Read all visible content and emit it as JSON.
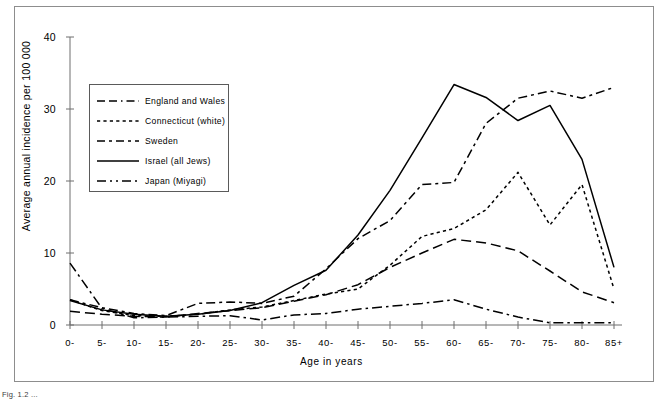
{
  "figure": {
    "caption": "Fig. 1.2 ...",
    "frame_color": "#8d8d8d"
  },
  "chart_data": {
    "type": "line",
    "title": "",
    "xlabel": "Age in years",
    "ylabel": "Average annual incidence per 100 000",
    "categories": [
      "0-",
      "5-",
      "10-",
      "15-",
      "20-",
      "25-",
      "30-",
      "35-",
      "40-",
      "45-",
      "50-",
      "55-",
      "60-",
      "65-",
      "70-",
      "75-",
      "80-",
      "85+"
    ],
    "xlim": [
      0,
      17
    ],
    "ylim": [
      0,
      40
    ],
    "yticks": [
      0,
      10,
      20,
      30,
      40
    ],
    "grid": false,
    "legend_position": "upper-left-inside",
    "series": [
      {
        "name": "England and Wales",
        "dash": "long-dash",
        "legend_label": "England and Wales",
        "values": [
          1.9,
          1.5,
          1.2,
          1.1,
          1.6,
          2.0,
          2.4,
          3.3,
          4.2,
          5.6,
          8.0,
          10.0,
          11.9,
          11.4,
          10.3,
          7.5,
          4.6,
          3.1
        ]
      },
      {
        "name": "Connecticut (white)",
        "dash": "dotted",
        "legend_label": "Connecticut  (white)",
        "values": [
          3.5,
          2.0,
          1.3,
          1.2,
          1.5,
          2.1,
          2.5,
          3.4,
          4.3,
          5.0,
          8.3,
          12.3,
          13.4,
          16.0,
          21.2,
          13.9,
          19.5,
          5.0
        ]
      },
      {
        "name": "Sweden",
        "dash": "dash-dot",
        "legend_label": "Sweden",
        "values": [
          3.5,
          2.4,
          1.6,
          1.3,
          3.0,
          3.2,
          3.0,
          4.0,
          4.3,
          6.5,
          9.0,
          13.0,
          13.9,
          16.2,
          21.2,
          14.0,
          19.5,
          5.0
        ]
      },
      {
        "name": "Israel (all Jews)",
        "dash": "solid",
        "legend_label": "Israel  (all  Jews)",
        "values": [
          3.4,
          2.1,
          1.5,
          1.2,
          1.5,
          2.0,
          3.1,
          5.5,
          7.6,
          12.5,
          18.7,
          26.0,
          33.4,
          31.6,
          28.4,
          30.5,
          23.0,
          8.0
        ]
      },
      {
        "name": "Japan (Miyagi)",
        "dash": "long-dash-dot",
        "legend_label": "Japan (Miyagi)",
        "values": [
          8.6,
          2.3,
          1.0,
          1.1,
          1.2,
          1.3,
          0.7,
          1.4,
          1.6,
          2.2,
          2.6,
          3.0,
          3.5,
          2.2,
          1.1,
          0.3,
          0.3,
          0.3
        ]
      }
    ],
    "series_upper": [
      {
        "name": "Sweden",
        "note": "upper dash-dot curve rising steeply after age 45",
        "values": [
          3.5,
          2.4,
          1.6,
          1.3,
          3.0,
          3.2,
          3.0,
          4.0,
          7.8,
          12.0,
          14.5,
          19.5,
          19.8,
          28.0,
          31.5,
          32.5,
          31.5,
          33.0
        ]
      }
    ]
  }
}
